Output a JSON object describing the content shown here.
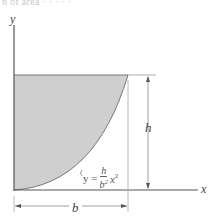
{
  "caption_fragment": "n of area · · · · ·",
  "axes": {
    "x_label": "x",
    "y_label": "y"
  },
  "dimensions": {
    "height_label": "h",
    "width_label": "b"
  },
  "equation": {
    "lhs": "y =",
    "numerator": "h",
    "denominator": "b",
    "denominator_exp": "2",
    "variable": "x",
    "variable_exp": "2",
    "full_text": "y = (h/b²) x²"
  },
  "colors": {
    "shaded_region": "#cfcfcf",
    "axis": "#555555",
    "dimension_line": "#888888",
    "background": "#ffffff"
  }
}
